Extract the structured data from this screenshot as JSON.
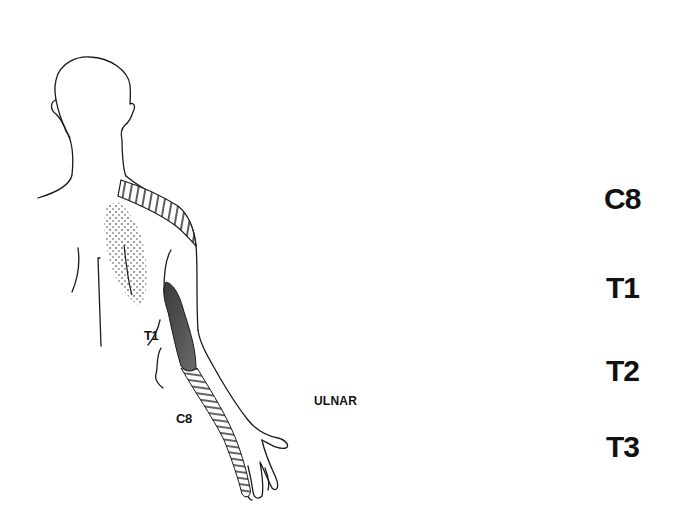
{
  "figure": {
    "left_panel": {
      "description": "Posterior view of figure with dermatome pain distribution",
      "labels": {
        "t1": "T1",
        "c8": "C8"
      }
    },
    "right_panel": {
      "description": "Apical tumor mass involving lower brachial plexus and sympathetic chain",
      "labels": {
        "ulnar": "ULNAR",
        "roots": [
          "C8",
          "T1",
          "T2",
          "T3"
        ]
      }
    },
    "colors": {
      "line": "#1a1a1a",
      "tumor_shade": "#9a9a9a",
      "dark_region": "#4a4a4a",
      "background": "#ffffff"
    }
  }
}
